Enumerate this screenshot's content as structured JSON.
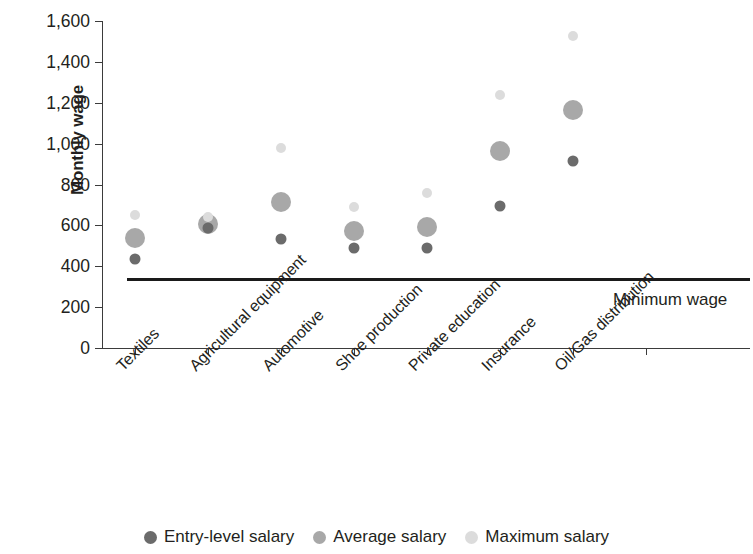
{
  "chart_data": {
    "type": "scatter",
    "title": "",
    "xlabel": "",
    "ylabel": "Monthly wage",
    "ylim": [
      0,
      1600
    ],
    "ytick_values": [
      0,
      200,
      400,
      600,
      800,
      1000,
      1200,
      1400,
      1600
    ],
    "ytick_labels": [
      "0",
      "200",
      "400",
      "600",
      "800",
      "1,000",
      "1,200",
      "1,400",
      "1,600"
    ],
    "grid": false,
    "legend_position": "bottom",
    "categories": [
      "Textiles",
      "Agricultural equipment",
      "Automotive",
      "Shoe production",
      "Private education",
      "Insurance",
      "Oil/Gas distribution"
    ],
    "series": [
      {
        "name": "Entry-level salary",
        "color": "#6b6b6b",
        "marker_size": 11,
        "values": [
          435,
          585,
          535,
          490,
          490,
          695,
          915
        ]
      },
      {
        "name": "Average salary",
        "color": "#a8a8a8",
        "marker_size": 20,
        "values": [
          540,
          608,
          715,
          572,
          590,
          965,
          1163
        ]
      },
      {
        "name": "Maximum salary",
        "color": "#dcdcdc",
        "marker_size": 10,
        "values": [
          653,
          640,
          980,
          688,
          757,
          1237,
          1527
        ]
      }
    ],
    "annotations": [
      {
        "name": "minimum-wage-line",
        "label": "Minimum wage",
        "value": 342,
        "type": "hline",
        "color": "#1a1a1a"
      }
    ]
  }
}
